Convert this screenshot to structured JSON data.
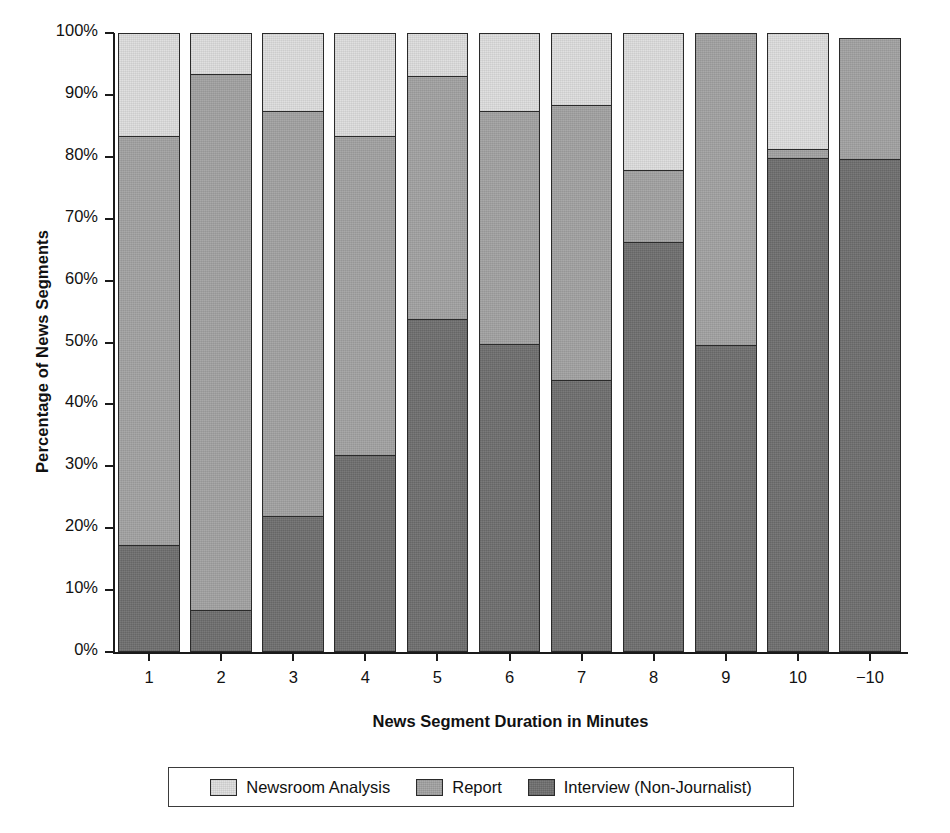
{
  "chart_data": {
    "type": "bar",
    "subtype": "stacked-bar-100-percent",
    "title": "",
    "xlabel": "News Segment Duration in Minutes",
    "ylabel": "Percentage of News Segments",
    "categories": [
      "1",
      "2",
      "3",
      "4",
      "5",
      "6",
      "7",
      "8",
      "9",
      "10",
      "−10"
    ],
    "ylim": [
      0,
      100
    ],
    "ytick_labels": [
      "0%",
      "10%",
      "20%",
      "30%",
      "40%",
      "50%",
      "60%",
      "70%",
      "80%",
      "90%",
      "100%"
    ],
    "ytick_values": [
      0,
      10,
      20,
      30,
      40,
      50,
      60,
      70,
      80,
      90,
      100
    ],
    "grid": false,
    "legend_position": "bottom",
    "series": [
      {
        "name": "Newsroom Analysis",
        "color": "#dedede",
        "values": [
          17.0,
          7.0,
          13.0,
          17.0,
          7.3,
          13.0,
          12.0,
          22.4,
          0.0,
          19.0,
          0.0
        ]
      },
      {
        "name": "Report",
        "color": "#a3a3a3",
        "values": [
          66.0,
          86.6,
          65.3,
          51.5,
          39.3,
          37.6,
          44.3,
          11.7,
          50.8,
          1.5,
          19.8
        ]
      },
      {
        "name": "Interview (Non-Journalist)",
        "color": "#6f6f6f",
        "values": [
          17.0,
          6.4,
          21.7,
          31.5,
          53.4,
          49.4,
          43.7,
          65.9,
          49.2,
          79.5,
          79.4
        ]
      }
    ],
    "bar_totals": [
      100.0,
      100.0,
      100.0,
      100.0,
      100.0,
      100.0,
      100.0,
      100.0,
      100.0,
      100.0,
      99.2
    ],
    "segment_boundaries_percent": {
      "interview_top": [
        17.0,
        6.4,
        21.7,
        31.5,
        53.4,
        49.4,
        43.7,
        65.9,
        49.2,
        79.5,
        79.4
      ],
      "report_top": [
        83.0,
        93.0,
        87.0,
        83.0,
        92.7,
        87.0,
        88.0,
        77.6,
        100.0,
        81.0,
        99.2
      ]
    }
  },
  "legend": {
    "items": [
      {
        "label": "Newsroom Analysis",
        "swatch": "legend-swatch-newsroom"
      },
      {
        "label": "Report",
        "swatch": "legend-swatch-report"
      },
      {
        "label": "Interview (Non-Journalist)",
        "swatch": "legend-swatch-interview"
      }
    ]
  }
}
